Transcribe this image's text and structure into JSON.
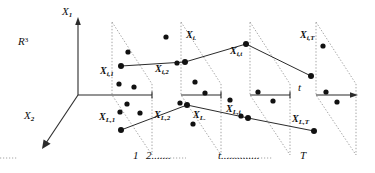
{
  "figure": {
    "type": "diagram",
    "space_label": "R",
    "space_exponent": "3",
    "axes": [
      {
        "name": "x1-axis",
        "label": "X",
        "sub": "1",
        "orientation": "vertical-up"
      },
      {
        "name": "x2-axis",
        "label": "X",
        "sub": "2",
        "orientation": "diagonal-down-left"
      },
      {
        "name": "t-axis",
        "label": "t",
        "sub": "",
        "orientation": "horizontal-right"
      }
    ],
    "planes": [
      {
        "id": "plane-1",
        "label": "1"
      },
      {
        "id": "plane-2",
        "label": "2......."
      },
      {
        "id": "plane-t",
        "label": "t.............."
      },
      {
        "id": "plane-T",
        "label": "T"
      }
    ],
    "upper_trajectory": {
      "name": "subject-i-trajectory",
      "points": [
        {
          "label": "X",
          "sub": "i,1"
        },
        {
          "label": "X",
          "sub": "i,2"
        },
        {
          "label": "X",
          "sub": "i."
        },
        {
          "label": "X",
          "sub": "i,t"
        },
        {
          "label": "X",
          "sub": "i,T"
        }
      ]
    },
    "lower_trajectory": {
      "name": "subject-L-trajectory",
      "points": [
        {
          "label": "X",
          "sub": "L,1"
        },
        {
          "label": "X",
          "sub": "L,2"
        },
        {
          "label": "X",
          "sub": "L."
        },
        {
          "label": "X",
          "sub": "L,t"
        },
        {
          "label": "X",
          "sub": "L,T"
        }
      ]
    },
    "colors": {
      "stroke": "#1a1a1a",
      "dotted": "#8a8a8a",
      "background": "#ffffff"
    }
  }
}
